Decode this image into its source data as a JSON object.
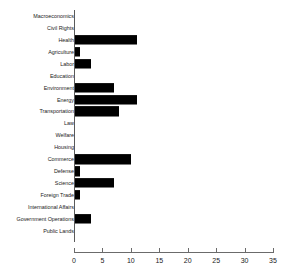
{
  "chart_data": {
    "type": "bar",
    "orientation": "horizontal",
    "title": "",
    "xlabel": "",
    "ylabel": "",
    "xlim": [
      0,
      35
    ],
    "xticks": [
      0,
      5,
      10,
      15,
      20,
      25,
      30,
      35
    ],
    "grid": false,
    "legend": false,
    "bar_color": "#000000",
    "axis_color": "#6b6b6b",
    "categories": [
      "Macroeconomics",
      "Civil Rights",
      "Health",
      "Agriculture",
      "Labor",
      "Education",
      "Environment",
      "Energy",
      "Transportation",
      "Law",
      "Welfare",
      "Housing",
      "Commerce",
      "Defense",
      "Science",
      "Foreign Trade",
      "International Affairs",
      "Government Operations",
      "Public Lands"
    ],
    "values": [
      0,
      0,
      11,
      1,
      3,
      0,
      7,
      11,
      8,
      0,
      0,
      0,
      10,
      1,
      7,
      1,
      0,
      3,
      0
    ]
  }
}
